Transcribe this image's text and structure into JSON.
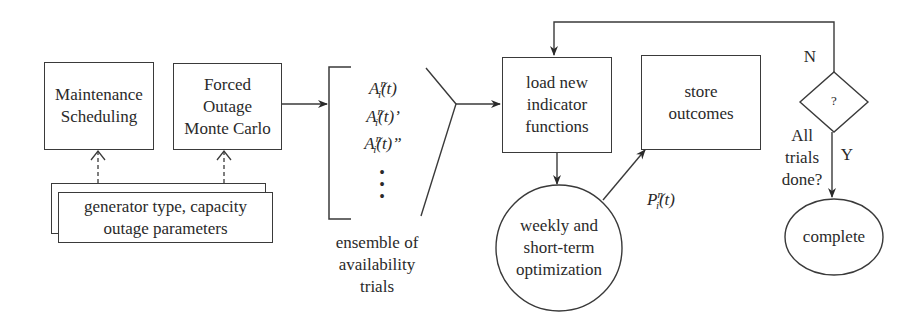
{
  "diagram": {
    "type": "flowchart",
    "nodes": {
      "maintenance": {
        "label": "Maintenance\nScheduling",
        "shape": "rectangle"
      },
      "forced_outage": {
        "label": "Forced\nOutage\nMonte Carlo",
        "shape": "rectangle"
      },
      "generator_params": {
        "label": "generator type, capacity\noutage parameters",
        "shape": "stacked-rectangle"
      },
      "ensemble": {
        "items": [
          "A",
          "A",
          "A"
        ],
        "item_suffixes": [
          "(t)",
          "(t)’",
          "(t)”"
        ],
        "superscript": "n",
        "subscript": "i",
        "ellipsis": "•\n•\n•",
        "caption": "ensemble of\navailability\ntrials",
        "shape": "bracket"
      },
      "load_indicator": {
        "label": "load new\nindicator\nfunctions",
        "shape": "rectangle"
      },
      "optimization": {
        "label": "weekly and\nshort-term\noptimization",
        "shape": "circle"
      },
      "store_outcomes": {
        "label": "store\noutcomes",
        "shape": "rectangle"
      },
      "decision": {
        "label": "?",
        "shape": "diamond",
        "question": "All\ntrials\ndone?"
      },
      "complete": {
        "label": "complete",
        "shape": "ellipse"
      }
    },
    "edge_labels": {
      "output_var": {
        "base": "P",
        "superscript": "n",
        "subscript": "i",
        "suffix": "(t)"
      },
      "no": "N",
      "yes": "Y"
    },
    "edges": [
      {
        "from": "generator_params",
        "to": "maintenance",
        "style": "dashed"
      },
      {
        "from": "generator_params",
        "to": "forced_outage",
        "style": "dashed"
      },
      {
        "from": "forced_outage",
        "to": "ensemble",
        "style": "solid"
      },
      {
        "from": "ensemble",
        "to": "load_indicator",
        "style": "solid"
      },
      {
        "from": "load_indicator",
        "to": "optimization",
        "style": "solid"
      },
      {
        "from": "optimization",
        "to": "store_outcomes",
        "style": "solid",
        "label": "P_i^n(t)"
      },
      {
        "from": "decision",
        "to": "load_indicator",
        "style": "solid",
        "label": "N"
      },
      {
        "from": "decision",
        "to": "complete",
        "style": "solid",
        "label": "Y"
      }
    ],
    "colors": {
      "stroke": "#3a3a3a",
      "text": "#2a2a2a",
      "background": "#ffffff"
    }
  }
}
